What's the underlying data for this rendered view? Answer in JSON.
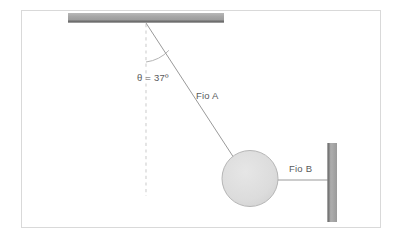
{
  "figure": {
    "type": "physics-free-body-diagram",
    "labels": {
      "angle": "θ = 37º",
      "string_a": "Fio A",
      "string_b": "Fio B"
    },
    "values": {
      "angle_symbol": "θ",
      "angle_value": "37",
      "angle_unit": "º"
    },
    "colors": {
      "frame_border": "#d9d9d9",
      "support_fill": "#a0a0a0",
      "support_edge": "#6e6e6e",
      "ball_fill": "#dedede",
      "ball_stroke": "#b0b0b0",
      "line": "#9a9a9a",
      "dashed_line": "#cfcfcf",
      "text": "#58595b",
      "background": "#ffffff"
    },
    "geometry": {
      "ceiling": {
        "x": 68,
        "y": 13,
        "width": 156,
        "height": 9
      },
      "pivot": {
        "x": 146,
        "y": 24
      },
      "ball": {
        "cx": 250,
        "cy": 178,
        "r": 28
      },
      "wall": {
        "x": 327,
        "y": 143,
        "width": 10,
        "height": 79
      },
      "plumb_line": {
        "x": 146,
        "y_start": 24,
        "y_end": 196
      },
      "string_b": {
        "x_start": 278,
        "x_end": 327,
        "y": 180
      }
    },
    "elements": [
      "ceiling-support",
      "pivot-point",
      "string-a",
      "plumb-line",
      "angle-arc",
      "ball",
      "string-b",
      "wall-support"
    ]
  }
}
